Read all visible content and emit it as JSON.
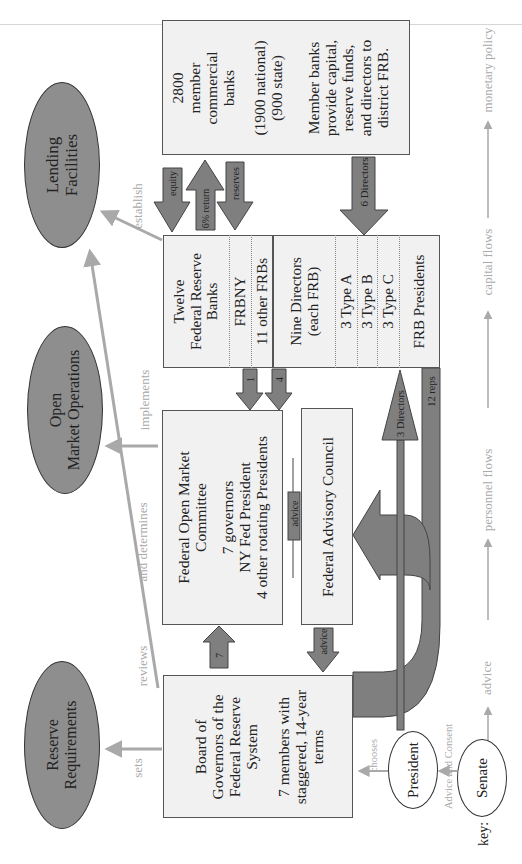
{
  "ellipses": {
    "lending": "Lending Facilities",
    "open_market_1": "Open",
    "open_market_2": "Market Operations",
    "reserve_1": "Reserve",
    "reserve_2": "Requirements",
    "president": "President",
    "senate": "Senate"
  },
  "banks_box": {
    "line1": "2800",
    "line2": "member",
    "line3": "commercial",
    "line4": "banks",
    "sub1": "(1900 national)",
    "sub2": "(900 state)",
    "desc1": "Member banks",
    "desc2": "provide capital,",
    "desc3": "reserve funds,",
    "desc4": "and directors to",
    "desc5": "district FRB."
  },
  "frb_box": {
    "title1": "Twelve",
    "title2": "Federal Reserve",
    "title3": "Banks",
    "frbny": "FRBNY",
    "other": "11 other FRBs",
    "directors1": "Nine Directors",
    "directors2": "(each FRB)",
    "type_a": "3 Type A",
    "type_b": "3 Type B",
    "type_c": "3 Type C",
    "presidents": "FRB Presidents"
  },
  "fomc_box": {
    "title1": "Federal Open Market",
    "title2": "Committee",
    "m1": "7 governors",
    "m2": "NY Fed President",
    "m3": "4 other rotating Presidents"
  },
  "fac_box": {
    "title": "Federal Advisory Council"
  },
  "board_box": {
    "t1": "Board of",
    "t2": "Governors of the",
    "t3": "Federal Reserve",
    "t4": "System",
    "d1": "7 members with",
    "d2": "staggered, 14-year",
    "d3": "terms"
  },
  "arrows": {
    "equity": "equity",
    "return": "6% return",
    "reserves": "reserves",
    "six_directors": "6 Directors",
    "one": "1",
    "four": "4",
    "seven": "7",
    "advice_fac_fomc": "advice",
    "advice_fac_board": "advice",
    "three_directors": "3 Directors",
    "twelve_reps": "12 reps"
  },
  "edge_labels": {
    "establish": "establish",
    "implements": "implements",
    "and_determines": "and determines",
    "reviews": "reviews",
    "sets": "sets",
    "chooses": "chooses",
    "advice_consent": "Advice and Consent"
  },
  "key": {
    "label": "key:",
    "advice": "advice",
    "personnel": "personnel flows",
    "capital": "capital flows",
    "monetary": "monetary policy"
  },
  "colors": {
    "ellipse_fill": "#8e8e8e",
    "box_fill": "#f1f1f1",
    "arrow_fill": "#7f7f7f",
    "monetary_line": "#a9a9a9"
  }
}
